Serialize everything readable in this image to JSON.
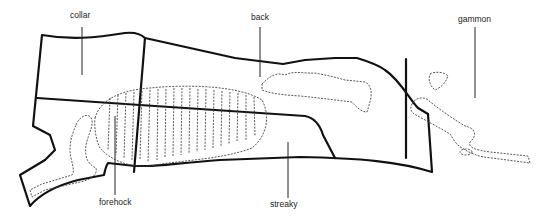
{
  "diagram": {
    "title": "",
    "labels": {
      "collar": "collar",
      "back": "back",
      "gammon": "gammon",
      "forehock": "forehock",
      "streaky": "streaky"
    },
    "colors": {
      "outline": "#111111",
      "bone": "#444444",
      "background": "#ffffff"
    }
  }
}
